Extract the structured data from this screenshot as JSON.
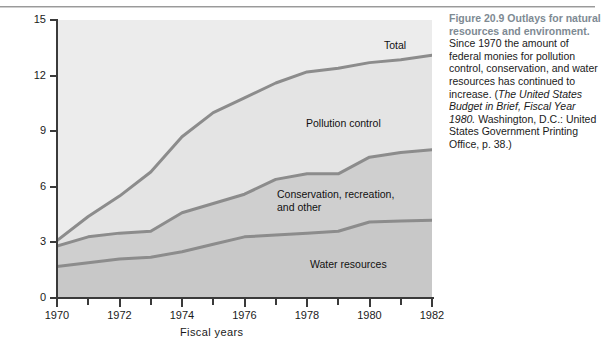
{
  "chart_data": {
    "type": "area",
    "title": "Outlays for natural resources and environment",
    "xlabel": "Fiscal years",
    "ylabel": "$ billions",
    "xlim": [
      1970,
      1982
    ],
    "ylim": [
      0,
      15
    ],
    "yticks": [
      0,
      3,
      6,
      9,
      12,
      15
    ],
    "xticks": [
      1970,
      1971,
      1972,
      1973,
      1974,
      1975,
      1976,
      1977,
      1978,
      1979,
      1980,
      1981,
      1982
    ],
    "xtick_labels": [
      "1970",
      "",
      "1972",
      "",
      "1974",
      "",
      "1976",
      "",
      "1978",
      "",
      "1980",
      "",
      "1982"
    ],
    "grid": false,
    "legend": "inline annotations",
    "stacked": true,
    "x": [
      1970,
      1971,
      1972,
      1973,
      1974,
      1975,
      1976,
      1977,
      1978,
      1979,
      1980,
      1981,
      1982
    ],
    "series": [
      {
        "name": "Water resources",
        "values": [
          1.7,
          1.9,
          2.1,
          2.2,
          2.5,
          2.9,
          3.3,
          3.4,
          3.5,
          3.6,
          4.1,
          4.15,
          4.2
        ]
      },
      {
        "name": "Conservation, recreation, and other",
        "values": [
          1.1,
          1.4,
          1.4,
          1.4,
          2.1,
          2.2,
          2.3,
          3.0,
          3.2,
          3.1,
          3.5,
          3.7,
          3.8
        ]
      },
      {
        "name": "Pollution control",
        "values": [
          0.3,
          1.1,
          2.0,
          3.2,
          4.1,
          4.9,
          5.2,
          5.2,
          5.5,
          5.7,
          5.1,
          5.0,
          5.1
        ]
      }
    ],
    "cumulative_totals": [
      3.1,
      4.4,
      5.5,
      6.8,
      8.7,
      10.0,
      10.8,
      11.6,
      12.2,
      12.4,
      12.7,
      13.0,
      13.1
    ],
    "annotations": [
      {
        "text": "Total",
        "series": "total"
      },
      {
        "text": "Pollution control",
        "series": "pollution-control"
      },
      {
        "text": "Conservation, recreation,\nand other",
        "series": "conservation"
      },
      {
        "text": "Water resources",
        "series": "water-resources"
      }
    ],
    "colors": {
      "line": "#8c8c8c",
      "band_top": "#e4e4e4",
      "band_mid": "#cfcfcf",
      "band_bottom": "#c8c8c8",
      "axis": "#3a3a3a",
      "text": "#1a1a1a",
      "caption_heading": "#7e8a93"
    }
  },
  "caption": {
    "heading": "Figure 20.9     Outlays for natural resources and environment.",
    "body_lines": [
      "Since 1970 the amount of",
      "federal monies for pollution",
      "control, conservation, and",
      "water resources has",
      "continued to increase. (The",
      "United States Budget in Brief,",
      "Fiscal Year 1980.",
      "Washington, D.C.: United",
      "States Government Printing",
      "Office, p. 38.)"
    ],
    "source_italic_start": "The United States Budget in Brief, Fiscal Year 1980."
  }
}
